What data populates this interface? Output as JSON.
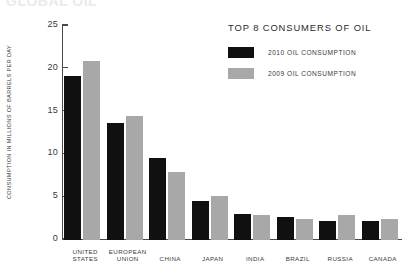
{
  "cut_title": "GLOBAL OIL",
  "legend": {
    "title": "TOP 8 CONSUMERS OF OIL",
    "entries": [
      {
        "label": "2010 OIL CONSUMPTION",
        "color": "#101010"
      },
      {
        "label": "2009 OIL CONSUMPTION",
        "color": "#a8a8a8"
      }
    ]
  },
  "chart_data": {
    "type": "bar",
    "title": "TOP 8 CONSUMERS OF OIL",
    "xlabel": "",
    "ylabel": "CONSUMPTION IN MILLIONS OF BARRELS PER DAY",
    "ylim": [
      0,
      25
    ],
    "yticks": [
      0,
      5,
      10,
      15,
      20,
      25
    ],
    "ytick_labels": [
      "0",
      "5",
      "10",
      "15",
      "20",
      "25"
    ],
    "grid": false,
    "legend_position": "top-right",
    "categories": [
      "UNITED STATES",
      "EUROPEAN UNION",
      "CHINA",
      "JAPAN",
      "INDIA",
      "BRAZIL",
      "RUSSIA",
      "CANADA"
    ],
    "category_lines": [
      [
        "UNITED",
        "STATES"
      ],
      [
        "EUROPEAN",
        "UNION"
      ],
      [
        "CHINA",
        ""
      ],
      [
        "JAPAN",
        ""
      ],
      [
        "INDIA",
        ""
      ],
      [
        "BRAZIL",
        ""
      ],
      [
        "RUSSIA",
        ""
      ],
      [
        "CANADA",
        ""
      ]
    ],
    "series": [
      {
        "name": "2010 OIL CONSUMPTION",
        "color": "#101010",
        "values": [
          19.2,
          13.7,
          9.6,
          4.6,
          3.0,
          2.7,
          2.2,
          2.2
        ]
      },
      {
        "name": "2009 OIL CONSUMPTION",
        "color": "#a8a8a8",
        "values": [
          20.9,
          14.5,
          8.0,
          5.1,
          2.9,
          2.4,
          2.9,
          2.5
        ]
      }
    ]
  }
}
